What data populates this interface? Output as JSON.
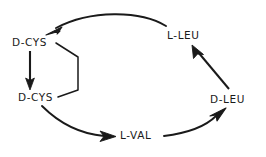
{
  "diagram": {
    "type": "cyclic-peptide-sequence-diagram",
    "background_color": "#ffffff",
    "stroke_color": "#1a1a1a",
    "text_color": "#1a1a1a",
    "nodes": [
      {
        "id": "d-cys-top",
        "label": "D-CYS",
        "x": 12,
        "y": 36
      },
      {
        "id": "d-cys-bot",
        "label": "D-CYS",
        "x": 18,
        "y": 91
      },
      {
        "id": "l-leu",
        "label": "L-LEU",
        "x": 167,
        "y": 29
      },
      {
        "id": "d-leu",
        "label": "D-LEU",
        "x": 210,
        "y": 93
      },
      {
        "id": "l-val",
        "label": "L-VAL",
        "x": 120,
        "y": 129
      }
    ],
    "edges": [
      {
        "id": "edge-l-leu-to-d-cys-top",
        "from": "l-leu",
        "to": "d-cys-top",
        "style": "curved-arrow"
      },
      {
        "id": "edge-d-cys-top-to-d-cys-bot",
        "from": "d-cys-top",
        "to": "d-cys-bot",
        "style": "straight-arrow"
      },
      {
        "id": "edge-d-cys-bot-to-l-val",
        "from": "d-cys-bot",
        "to": "l-val",
        "style": "curved-arrow"
      },
      {
        "id": "edge-l-val-to-d-leu",
        "from": "l-val",
        "to": "d-leu",
        "style": "curved-arrow"
      },
      {
        "id": "edge-d-leu-to-l-leu",
        "from": "d-leu",
        "to": "l-leu",
        "style": "straight-arrow"
      }
    ],
    "bridges": [
      {
        "id": "disulfide-bridge",
        "from": "d-cys-top",
        "to": "d-cys-bot",
        "style": "bracket"
      }
    ]
  }
}
